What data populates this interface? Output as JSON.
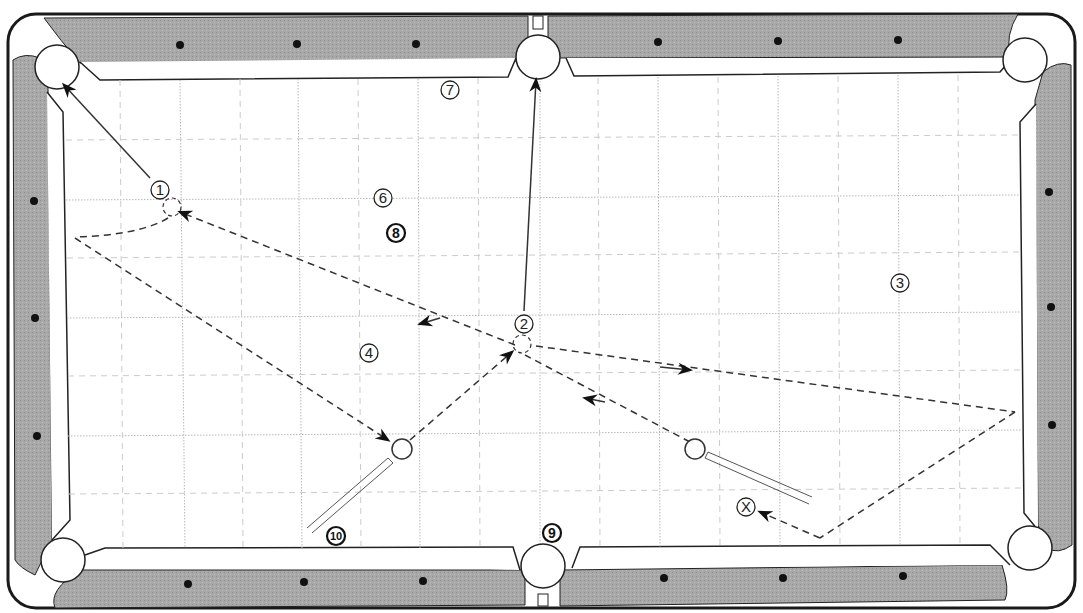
{
  "diagram": {
    "type": "pool-table-shot-diagram",
    "colors": {
      "rail": "#a9a9a9",
      "frame": "#222222",
      "cloth": "#ffffff",
      "cushion": "#ffffff",
      "grid": "#b5b5b5",
      "path": "#333333"
    },
    "labels": [
      {
        "id": "1",
        "text": "1",
        "x": 160,
        "y": 190,
        "style": "circled"
      },
      {
        "id": "2",
        "text": "2",
        "x": 524,
        "y": 324,
        "style": "circled"
      },
      {
        "id": "3",
        "text": "3",
        "x": 900,
        "y": 283,
        "style": "circled"
      },
      {
        "id": "4",
        "text": "4",
        "x": 369,
        "y": 353,
        "style": "circled"
      },
      {
        "id": "6",
        "text": "6",
        "x": 383,
        "y": 198,
        "style": "circled"
      },
      {
        "id": "7",
        "text": "7",
        "x": 450,
        "y": 90,
        "style": "circled"
      },
      {
        "id": "8",
        "text": "8",
        "x": 396,
        "y": 233,
        "style": "circled-bold"
      },
      {
        "id": "9",
        "text": "9",
        "x": 552,
        "y": 533,
        "style": "circled-bold"
      },
      {
        "id": "10",
        "text": "10",
        "x": 336,
        "y": 536,
        "style": "circled-bold"
      },
      {
        "id": "x",
        "text": "X",
        "x": 746,
        "y": 507,
        "style": "circled"
      }
    ],
    "pockets": [
      {
        "name": "top-left",
        "x": 57,
        "y": 67
      },
      {
        "name": "top-middle",
        "x": 538,
        "y": 57
      },
      {
        "name": "top-right",
        "x": 1025,
        "y": 60
      },
      {
        "name": "bottom-left",
        "x": 63,
        "y": 560
      },
      {
        "name": "bottom-middle",
        "x": 543,
        "y": 566
      },
      {
        "name": "bottom-right",
        "x": 1030,
        "y": 548
      }
    ],
    "cue_balls": [
      {
        "name": "cue-ball-left",
        "x": 402,
        "y": 449
      },
      {
        "name": "cue-ball-right",
        "x": 695,
        "y": 449
      }
    ],
    "ghost_balls": [
      {
        "name": "ghost-ball-1",
        "x": 170,
        "y": 208
      },
      {
        "name": "ghost-ball-2",
        "x": 522,
        "y": 344
      }
    ]
  }
}
